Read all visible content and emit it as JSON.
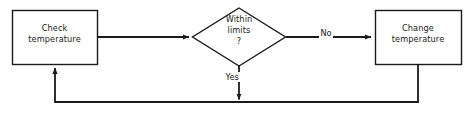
{
  "diagram": {
    "colors": {
      "background": "#ffffff",
      "stroke": "#1a1a1a",
      "text": "#1a1a1a"
    },
    "nodes": [
      {
        "id": "check-temperature",
        "shape": "process-rectangle",
        "label": "Check\ntemperature"
      },
      {
        "id": "within-limits",
        "shape": "decision-diamond",
        "label": "Within\nlimits\n?"
      },
      {
        "id": "change-temperature",
        "shape": "process-rectangle",
        "label": "Change\ntemperature"
      }
    ],
    "edges": [
      {
        "id": "check-to-decision",
        "from": "check-temperature",
        "to": "within-limits",
        "label": ""
      },
      {
        "id": "decision-to-change",
        "from": "within-limits",
        "to": "change-temperature",
        "label": "No"
      },
      {
        "id": "decision-to-loop",
        "from": "within-limits",
        "to": "feedback-rail",
        "label": "Yes"
      },
      {
        "id": "change-to-loop",
        "from": "change-temperature",
        "to": "check-temperature",
        "label": ""
      }
    ]
  }
}
